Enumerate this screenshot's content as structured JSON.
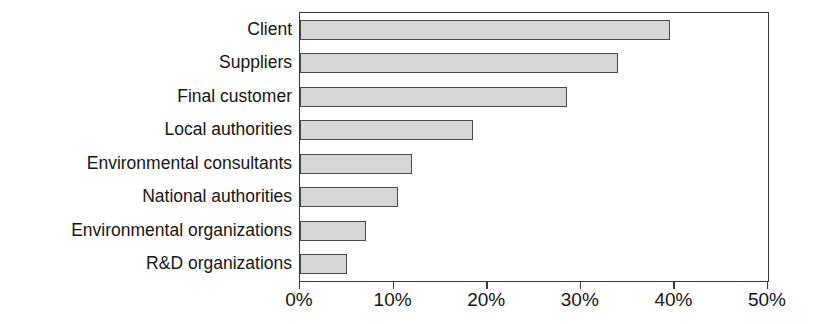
{
  "chart_data": {
    "type": "bar",
    "orientation": "horizontal",
    "title": "",
    "xlabel": "",
    "ylabel": "",
    "categories": [
      "Client",
      "Suppliers",
      "Final customer",
      "Local authorities",
      "Environmental consultants",
      "National authorities",
      "Environmental organizations",
      "R&D organizations"
    ],
    "values": [
      39.5,
      34.0,
      28.5,
      18.5,
      12.0,
      10.5,
      7.0,
      5.0
    ],
    "value_unit": "%",
    "xlim": [
      0,
      50
    ],
    "xticks": [
      0,
      10,
      20,
      30,
      40,
      50
    ],
    "xtick_labels": [
      "0%",
      "10%",
      "20%",
      "30%",
      "40%",
      "50%"
    ],
    "grid": false,
    "legend": "none",
    "bar_fill_color": "#d7d7d7",
    "bar_border_color": "#4a4a4a",
    "axis_color": "#3a3a3a",
    "background_color": "#ffffff"
  }
}
